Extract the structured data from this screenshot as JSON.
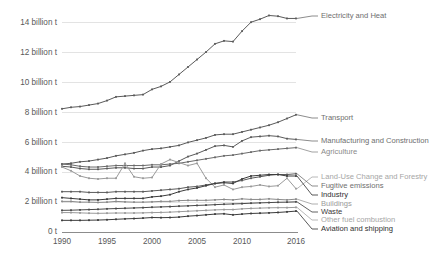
{
  "chart_data": {
    "type": "line",
    "title": "",
    "subtitle": "",
    "xlabel": "",
    "ylabel": "",
    "grid": "horizontal",
    "legend_position": "right-inline-labels",
    "x": [
      1990,
      1991,
      1992,
      1993,
      1994,
      1995,
      1996,
      1997,
      1998,
      1999,
      2000,
      2001,
      2002,
      2003,
      2004,
      2005,
      2006,
      2007,
      2008,
      2009,
      2010,
      2011,
      2012,
      2013,
      2014,
      2015,
      2016
    ],
    "x_ticks": [
      "1990",
      "1995",
      "2000",
      "2005",
      "2010",
      "2016"
    ],
    "x_tick_values": [
      1990,
      1995,
      2000,
      2005,
      2010,
      2016
    ],
    "y_ticks": [
      "0 t",
      "2 billion t",
      "4 billion t",
      "6 billion t",
      "8 billion t",
      "10 billion t",
      "12 billion t",
      "14 billion t"
    ],
    "y_tick_values": [
      0,
      2,
      4,
      6,
      8,
      10,
      12,
      14
    ],
    "ylim": [
      0,
      15
    ],
    "xlim": [
      1990,
      2016
    ],
    "unit": "billion t",
    "series": [
      {
        "name": "Electricity and Heat",
        "color": "#5a5a5a",
        "label_color": "#6e6e6e",
        "values": [
          8.25,
          8.35,
          8.4,
          8.5,
          8.6,
          8.8,
          9.05,
          9.1,
          9.15,
          9.2,
          9.55,
          9.75,
          10.05,
          10.55,
          11.05,
          11.55,
          12.05,
          12.6,
          12.8,
          12.75,
          13.45,
          14.05,
          14.25,
          14.5,
          14.45,
          14.3,
          14.3
        ]
      },
      {
        "name": "Transport",
        "color": "#5a5a5a",
        "label_color": "#6e6e6e",
        "values": [
          4.55,
          4.6,
          4.7,
          4.75,
          4.85,
          4.95,
          5.1,
          5.2,
          5.3,
          5.45,
          5.55,
          5.6,
          5.7,
          5.8,
          6.0,
          6.15,
          6.3,
          6.5,
          6.55,
          6.55,
          6.7,
          6.85,
          7.0,
          7.15,
          7.35,
          7.6,
          7.85
        ]
      },
      {
        "name": "Manufacturing and Construction",
        "color": "#5a5a5a",
        "label_color": "#6e6e6e",
        "values": [
          4.4,
          4.35,
          4.25,
          4.2,
          4.2,
          4.25,
          4.3,
          4.3,
          4.25,
          4.25,
          4.35,
          4.35,
          4.45,
          4.75,
          5.05,
          5.25,
          5.5,
          5.75,
          5.8,
          5.7,
          6.1,
          6.35,
          6.4,
          6.45,
          6.4,
          6.25,
          6.2
        ]
      },
      {
        "name": "Agriculture",
        "color": "#6a6a6a",
        "label_color": "#8a8a8a",
        "values": [
          4.55,
          4.5,
          4.4,
          4.35,
          4.35,
          4.4,
          4.45,
          4.45,
          4.45,
          4.45,
          4.5,
          4.5,
          4.55,
          4.6,
          4.7,
          4.8,
          4.9,
          5.0,
          5.1,
          5.15,
          5.25,
          5.35,
          5.45,
          5.5,
          5.55,
          5.6,
          5.65
        ]
      },
      {
        "name": "Land-Use Change and Forestry",
        "color": "#9a9a9a",
        "label_color": "#a6a6a6",
        "values": [
          4.35,
          4.1,
          3.75,
          3.6,
          3.55,
          3.6,
          3.6,
          4.6,
          3.7,
          3.6,
          3.65,
          4.55,
          4.85,
          4.65,
          4.45,
          4.6,
          3.6,
          3.0,
          3.15,
          2.85,
          3.0,
          3.05,
          3.15,
          3.05,
          3.1,
          3.6,
          2.9
        ]
      },
      {
        "name": "Fugitive emissions",
        "color": "#5a5a5a",
        "label_color": "#6e6e6e",
        "values": [
          2.7,
          2.7,
          2.7,
          2.65,
          2.65,
          2.65,
          2.7,
          2.7,
          2.7,
          2.7,
          2.75,
          2.8,
          2.85,
          2.9,
          3.0,
          3.05,
          3.15,
          3.25,
          3.35,
          3.35,
          3.45,
          3.6,
          3.7,
          3.8,
          3.85,
          3.85,
          3.9
        ]
      },
      {
        "name": "Industry",
        "color": "#3c3c3c",
        "label_color": "#2f2f2f",
        "values": [
          2.3,
          2.25,
          2.2,
          2.15,
          2.15,
          2.2,
          2.25,
          2.25,
          2.25,
          2.25,
          2.35,
          2.4,
          2.5,
          2.7,
          2.85,
          2.95,
          3.1,
          3.25,
          3.3,
          3.25,
          3.55,
          3.75,
          3.8,
          3.85,
          3.85,
          3.75,
          3.75
        ]
      },
      {
        "name": "Buildings",
        "color": "#8a8a8a",
        "label_color": "#9a9a9a",
        "values": [
          2.05,
          2.05,
          2.0,
          2.0,
          1.98,
          2.0,
          2.05,
          2.02,
          2.0,
          2.0,
          2.02,
          2.05,
          2.05,
          2.1,
          2.12,
          2.12,
          2.12,
          2.15,
          2.18,
          2.15,
          2.22,
          2.18,
          2.18,
          2.22,
          2.18,
          2.15,
          2.2
        ]
      },
      {
        "name": "Waste",
        "color": "#4a4a4a",
        "label_color": "#3a3a3a",
        "values": [
          1.45,
          1.46,
          1.48,
          1.5,
          1.52,
          1.55,
          1.57,
          1.59,
          1.61,
          1.63,
          1.66,
          1.68,
          1.7,
          1.73,
          1.75,
          1.78,
          1.8,
          1.83,
          1.86,
          1.88,
          1.9,
          1.93,
          1.95,
          1.97,
          1.99,
          2.0,
          2.02
        ]
      },
      {
        "name": "Other fuel combustion",
        "color": "#9a9a9a",
        "label_color": "#a6a6a6",
        "values": [
          1.3,
          1.3,
          1.28,
          1.26,
          1.25,
          1.26,
          1.27,
          1.27,
          1.27,
          1.28,
          1.3,
          1.31,
          1.33,
          1.36,
          1.39,
          1.42,
          1.45,
          1.48,
          1.5,
          1.5,
          1.55,
          1.58,
          1.6,
          1.62,
          1.63,
          1.63,
          1.65
        ]
      },
      {
        "name": "Aviation and shipping",
        "color": "#3c3c3c",
        "label_color": "#2f2f2f",
        "values": [
          0.78,
          0.78,
          0.78,
          0.79,
          0.8,
          0.82,
          0.85,
          0.88,
          0.9,
          0.93,
          0.97,
          0.96,
          0.97,
          1.0,
          1.06,
          1.1,
          1.15,
          1.2,
          1.22,
          1.15,
          1.2,
          1.24,
          1.26,
          1.28,
          1.31,
          1.35,
          1.4
        ]
      }
    ],
    "legend_entries": [
      {
        "label": "Electricity and Heat",
        "y": 16
      },
      {
        "label": "Transport",
        "y": 118
      },
      {
        "label": "Manufacturing and Construction",
        "y": 141
      },
      {
        "label": "Agriculture",
        "y": 152
      },
      {
        "label": "Land-Use Change and Forestry",
        "y": 177
      },
      {
        "label": "Fugitive emissions",
        "y": 186
      },
      {
        "label": "Industry",
        "y": 195
      },
      {
        "label": "Buildings",
        "y": 204
      },
      {
        "label": "Waste",
        "y": 212
      },
      {
        "label": "Other fuel combustion",
        "y": 220
      },
      {
        "label": "Aviation and shipping",
        "y": 229
      }
    ]
  }
}
